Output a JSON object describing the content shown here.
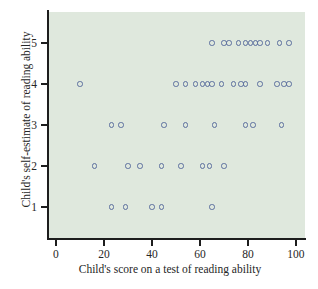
{
  "chart_data": {
    "type": "scatter",
    "title": "",
    "xlabel": "Child's score on a test of reading ability",
    "ylabel": "Child's self-estimate of reading ability",
    "xlim": [
      -3,
      104
    ],
    "ylim": [
      0.4,
      5.6
    ],
    "xticks": [
      0,
      20,
      40,
      60,
      80,
      100
    ],
    "xtick_labels": [
      "0",
      "20",
      "40",
      "60",
      "80",
      "100"
    ],
    "yticks": [
      1,
      2,
      3,
      4,
      5
    ],
    "ytick_labels": [
      "1",
      "2",
      "3",
      "4",
      "5"
    ],
    "grid": false,
    "legend": null,
    "marker": "open-circle",
    "marker_color": "#5c6f9e",
    "panel_color": "#dfe8dd",
    "points": [
      {
        "x": 65,
        "y": 5
      },
      {
        "x": 70,
        "y": 5
      },
      {
        "x": 72,
        "y": 5
      },
      {
        "x": 76,
        "y": 5
      },
      {
        "x": 79,
        "y": 5
      },
      {
        "x": 81,
        "y": 5
      },
      {
        "x": 83,
        "y": 5
      },
      {
        "x": 85,
        "y": 5
      },
      {
        "x": 88,
        "y": 5
      },
      {
        "x": 93,
        "y": 5
      },
      {
        "x": 97,
        "y": 5
      },
      {
        "x": 10,
        "y": 4
      },
      {
        "x": 50,
        "y": 4
      },
      {
        "x": 54,
        "y": 4
      },
      {
        "x": 58,
        "y": 4
      },
      {
        "x": 61,
        "y": 4
      },
      {
        "x": 63,
        "y": 4
      },
      {
        "x": 65,
        "y": 4
      },
      {
        "x": 69,
        "y": 4
      },
      {
        "x": 74,
        "y": 4
      },
      {
        "x": 77,
        "y": 4
      },
      {
        "x": 79,
        "y": 4
      },
      {
        "x": 85,
        "y": 4
      },
      {
        "x": 92,
        "y": 4
      },
      {
        "x": 95,
        "y": 4
      },
      {
        "x": 97,
        "y": 4
      },
      {
        "x": 23,
        "y": 3
      },
      {
        "x": 27,
        "y": 3
      },
      {
        "x": 45,
        "y": 3
      },
      {
        "x": 54,
        "y": 3
      },
      {
        "x": 66,
        "y": 3
      },
      {
        "x": 79,
        "y": 3
      },
      {
        "x": 82,
        "y": 3
      },
      {
        "x": 94,
        "y": 3
      },
      {
        "x": 16,
        "y": 2
      },
      {
        "x": 30,
        "y": 2
      },
      {
        "x": 35,
        "y": 2
      },
      {
        "x": 44,
        "y": 2
      },
      {
        "x": 52,
        "y": 2
      },
      {
        "x": 61,
        "y": 2
      },
      {
        "x": 64,
        "y": 2
      },
      {
        "x": 70,
        "y": 2
      },
      {
        "x": 23,
        "y": 1
      },
      {
        "x": 29,
        "y": 1
      },
      {
        "x": 40,
        "y": 1
      },
      {
        "x": 44,
        "y": 1
      },
      {
        "x": 65,
        "y": 1
      }
    ]
  }
}
